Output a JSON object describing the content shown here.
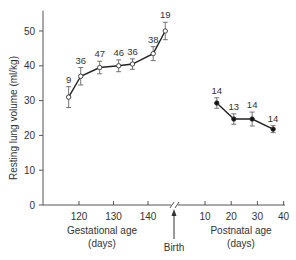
{
  "chart_data": {
    "type": "line",
    "title": "",
    "ylabel": "Resting lung volume (ml/kg)",
    "ylim": [
      0,
      55
    ],
    "yticks": [
      0,
      10,
      20,
      30,
      40,
      50
    ],
    "grid": false,
    "legend": null,
    "annotations": [
      {
        "text": "Birth",
        "type": "arrow",
        "position": "axis break"
      }
    ],
    "panels": [
      {
        "name": "gestational",
        "xlabel": "Gestational age (days)",
        "xlabel_line1": "Gestational age",
        "xlabel_line2": "(days)",
        "xticks": [
          120,
          130,
          140
        ],
        "marker": "open-circle",
        "series": [
          {
            "name": "Gestational",
            "x": [
              117,
              120.5,
              126,
              131.5,
              135.5,
              141.5,
              145
            ],
            "y": [
              31,
              37,
              39.5,
              40,
              40.5,
              43.5,
              50
            ],
            "err": [
              3,
              2.5,
              1.8,
              1.7,
              1.5,
              2,
              2.5
            ],
            "n": [
              "9",
              "36",
              "47",
              "46",
              "36",
              "38",
              "19"
            ]
          }
        ]
      },
      {
        "name": "postnatal",
        "xlabel": "Postnatal age (days)",
        "xlabel_line1": "Postnatal age",
        "xlabel_line2": "(days)",
        "xticks": [
          10,
          20,
          30,
          40
        ],
        "marker": "filled-circle",
        "series": [
          {
            "name": "Postnatal",
            "x": [
              14.5,
              21,
              28,
              36
            ],
            "y": [
              29.3,
              24.7,
              24.7,
              21.8
            ],
            "err": [
              1.5,
              1.5,
              2,
              1
            ],
            "n": [
              "14",
              "13",
              "14",
              "14"
            ]
          }
        ]
      }
    ]
  },
  "labels": {
    "y_axis": "Resting lung volume (ml/kg)",
    "birth": "Birth"
  }
}
